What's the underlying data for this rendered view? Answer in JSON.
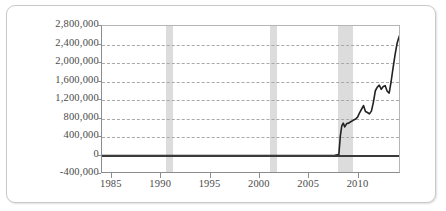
{
  "chart_data": {
    "type": "line",
    "title": "",
    "xlabel": "",
    "ylabel": "",
    "xlim": [
      1984.0,
      2014.3
    ],
    "ylim": [
      -400000,
      2800000
    ],
    "grid": true,
    "legend": null,
    "y_ticks": [
      2800000,
      2400000,
      2000000,
      1600000,
      1200000,
      800000,
      400000,
      0,
      -400000
    ],
    "y_tick_labels": [
      "2,800,000",
      "2,400,000",
      "2,000,000",
      "1,600,000",
      "1,200,000",
      "800,000",
      "400,000",
      "0",
      "-400,000"
    ],
    "x_ticks": [
      1985,
      1990,
      1995,
      2000,
      2005,
      2010
    ],
    "x_tick_labels": [
      "1985",
      "1990",
      "1995",
      "2000",
      "2005",
      "2010"
    ],
    "zero_line": 0,
    "colors": {
      "series": "#222222",
      "grid": "#a9a9a9",
      "zero_line": "#3a3a3a",
      "recession_band": "#d6d6d6",
      "axis": "#8c8c8c",
      "text": "#4a4a4a",
      "background": "#ffffff",
      "frame": "#c9c9c9"
    },
    "recession_bands": [
      {
        "label": "1990-1991 recession",
        "start": 1990.5,
        "end": 1991.2
      },
      {
        "label": "2001 recession",
        "start": 2001.0,
        "end": 2001.7
      },
      {
        "label": "2007-2009 recession",
        "start": 2007.9,
        "end": 2009.4
      }
    ],
    "series": [
      {
        "name": "Series 1",
        "x": [
          1984.0,
          1986.0,
          1988.0,
          1990.0,
          1992.0,
          1994.0,
          1996.0,
          1998.0,
          2000.0,
          2002.0,
          2004.0,
          2006.0,
          2007.0,
          2007.6,
          2008.0,
          2008.15,
          2008.3,
          2008.45,
          2008.6,
          2008.8,
          2009.0,
          2009.2,
          2009.45,
          2009.7,
          2009.9,
          2010.1,
          2010.3,
          2010.5,
          2010.7,
          2010.9,
          2011.1,
          2011.3,
          2011.5,
          2011.7,
          2011.9,
          2012.1,
          2012.3,
          2012.5,
          2012.7,
          2012.9,
          2013.1,
          2013.3,
          2013.5,
          2013.7,
          2013.9,
          2014.05,
          2014.2
        ],
        "y": [
          0,
          0,
          0,
          0,
          0,
          0,
          0,
          0,
          0,
          0,
          0,
          0,
          0,
          5000,
          20000,
          420000,
          640000,
          700000,
          620000,
          690000,
          700000,
          730000,
          760000,
          790000,
          830000,
          920000,
          1000000,
          1080000,
          950000,
          930000,
          900000,
          960000,
          1150000,
          1400000,
          1480000,
          1520000,
          1430000,
          1490000,
          1510000,
          1390000,
          1350000,
          1600000,
          1900000,
          2180000,
          2420000,
          2530000,
          2620000
        ]
      }
    ]
  }
}
